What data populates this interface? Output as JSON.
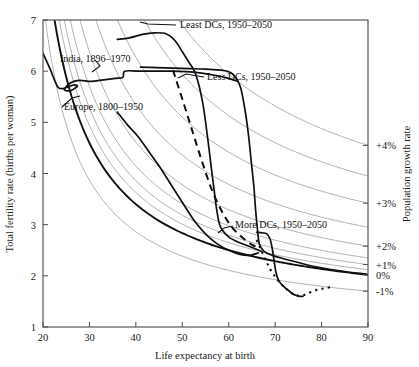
{
  "chart_data": {
    "type": "line",
    "title": "",
    "xlabel": "Life expectancy at birth",
    "ylabel": "Total fertility rate (births per woman)",
    "y2label": "Population growth rate",
    "xlim": [
      20,
      90
    ],
    "ylim": [
      1,
      7
    ],
    "xticks": [
      "20",
      "30",
      "40",
      "50",
      "60",
      "70",
      "80",
      "90"
    ],
    "yticks": [
      "1",
      "2",
      "3",
      "4",
      "5",
      "6",
      "7"
    ],
    "y2ticks": [
      "+4%",
      "+3%",
      "+2%",
      "+1%",
      "0%",
      "-1%"
    ],
    "grid": false,
    "legend_position": "inline-annotations",
    "iso_contours": [
      {
        "growth_pct": 4.0,
        "label": "+4%",
        "bold": false,
        "y_at_x90": 4.55
      },
      {
        "growth_pct": 3.5,
        "label": "",
        "bold": false,
        "y_at_x90": 3.95
      },
      {
        "growth_pct": 3.0,
        "label": "+3%",
        "bold": false,
        "y_at_x90": 3.42
      },
      {
        "growth_pct": 2.5,
        "label": "",
        "bold": false,
        "y_at_x90": 2.95
      },
      {
        "growth_pct": 2.0,
        "label": "+2%",
        "bold": false,
        "y_at_x90": 2.58
      },
      {
        "growth_pct": 1.5,
        "label": "",
        "bold": false,
        "y_at_x90": 2.35
      },
      {
        "growth_pct": 1.0,
        "label": "+1%",
        "bold": false,
        "y_at_x90": 2.22
      },
      {
        "growth_pct": 0.5,
        "label": "",
        "bold": false,
        "y_at_x90": 2.12
      },
      {
        "growth_pct": 0.0,
        "label": "0%",
        "bold": true,
        "y_at_x90": 2.02
      },
      {
        "growth_pct": -1.0,
        "label": "-1%",
        "bold": false,
        "y_at_x90": 1.7
      }
    ],
    "series": [
      {
        "name": "India, 1896-1970",
        "label": "India, 1896–1970",
        "style": "solid",
        "points": [
          [
            20.0,
            6.35
          ],
          [
            21.5,
            6.05
          ],
          [
            22.6,
            5.8
          ],
          [
            23.3,
            5.68
          ],
          [
            24.4,
            5.66
          ],
          [
            25.6,
            5.7
          ],
          [
            26.6,
            5.73
          ],
          [
            27.4,
            5.71
          ],
          [
            26.0,
            5.62
          ],
          [
            24.6,
            5.64
          ],
          [
            25.9,
            5.77
          ],
          [
            27.8,
            5.82
          ],
          [
            30.4,
            5.8
          ],
          [
            33.0,
            5.83
          ],
          [
            35.6,
            5.86
          ],
          [
            37.2,
            5.88
          ],
          [
            37.6,
            6.0
          ],
          [
            40.5,
            6.0
          ],
          [
            44.0,
            6.0
          ],
          [
            47.5,
            6.0
          ],
          [
            50.8,
            5.99
          ],
          [
            54.2,
            5.96
          ],
          [
            57.0,
            5.92
          ],
          [
            59.6,
            5.87
          ],
          [
            62.0,
            5.8
          ]
        ]
      },
      {
        "name": "Europe, 1800-1950",
        "label": "Europe, 1800–1950",
        "style": "solid",
        "points": [
          [
            36.0,
            5.2
          ],
          [
            38.2,
            4.95
          ],
          [
            40.5,
            4.72
          ],
          [
            43.0,
            4.4
          ],
          [
            45.5,
            4.08
          ],
          [
            48.0,
            3.72
          ],
          [
            50.4,
            3.38
          ],
          [
            52.8,
            3.05
          ],
          [
            55.2,
            2.8
          ],
          [
            57.6,
            2.62
          ],
          [
            60.0,
            2.5
          ],
          [
            62.4,
            2.42
          ],
          [
            64.6,
            2.4
          ],
          [
            66.4,
            2.45
          ]
        ]
      },
      {
        "name": "Least DCs, 1950-2050",
        "label": "Least DCs, 1950–2050",
        "style": "solid",
        "points": [
          [
            36.0,
            6.62
          ],
          [
            38.6,
            6.65
          ],
          [
            41.4,
            6.72
          ],
          [
            44.0,
            6.75
          ],
          [
            46.5,
            6.73
          ],
          [
            48.4,
            6.6
          ],
          [
            50.0,
            6.38
          ],
          [
            51.4,
            6.18
          ],
          [
            52.6,
            6.0
          ],
          [
            53.6,
            5.72
          ],
          [
            54.4,
            5.38
          ],
          [
            55.0,
            5.02
          ],
          [
            55.6,
            4.6
          ],
          [
            56.2,
            4.15
          ],
          [
            56.8,
            3.72
          ],
          [
            57.4,
            3.3
          ],
          [
            58.2,
            2.96
          ],
          [
            60.0,
            2.76
          ],
          [
            62.5,
            2.64
          ],
          [
            65.2,
            2.55
          ],
          [
            67.0,
            2.48
          ]
        ]
      },
      {
        "name": "Less DCs, 1950-2050",
        "label": "Less DCs, 1950–2050",
        "style": "solid",
        "points": [
          [
            41.0,
            6.08
          ],
          [
            44.5,
            6.07
          ],
          [
            48.0,
            6.06
          ],
          [
            51.5,
            6.05
          ],
          [
            55.0,
            6.04
          ],
          [
            58.4,
            6.02
          ],
          [
            60.6,
            5.96
          ],
          [
            62.4,
            5.72
          ],
          [
            63.4,
            5.3
          ],
          [
            64.2,
            4.8
          ],
          [
            64.8,
            4.28
          ],
          [
            65.4,
            3.76
          ],
          [
            65.8,
            3.28
          ],
          [
            66.2,
            2.9
          ],
          [
            66.6,
            2.62
          ],
          [
            67.6,
            2.48
          ],
          [
            69.4,
            2.4
          ],
          [
            72.0,
            2.33
          ],
          [
            75.0,
            2.26
          ],
          [
            78.5,
            2.18
          ],
          [
            82.0,
            2.12
          ],
          [
            86.0,
            2.07
          ],
          [
            89.5,
            2.04
          ]
        ]
      },
      {
        "name": "More DCs, 1950-2050",
        "label": "More DCs, 1950–2050",
        "style": "solid-then-dotted",
        "points": [
          [
            66.0,
            2.85
          ],
          [
            67.2,
            2.84
          ],
          [
            68.2,
            2.82
          ],
          [
            68.9,
            2.72
          ],
          [
            69.4,
            2.52
          ],
          [
            69.8,
            2.28
          ],
          [
            70.2,
            2.06
          ],
          [
            70.7,
            1.92
          ],
          [
            71.3,
            1.84
          ],
          [
            72.0,
            1.78
          ],
          [
            72.8,
            1.72
          ],
          [
            73.6,
            1.66
          ],
          [
            74.4,
            1.62
          ],
          [
            75.2,
            1.6
          ],
          [
            76.0,
            1.6
          ]
        ]
      },
      {
        "name": "Less DCs projection",
        "label": "",
        "style": "dashed",
        "points": [
          [
            48.0,
            6.02
          ],
          [
            50.2,
            5.4
          ],
          [
            52.2,
            4.82
          ],
          [
            54.2,
            4.25
          ],
          [
            56.2,
            3.72
          ],
          [
            58.4,
            3.28
          ],
          [
            60.6,
            2.96
          ],
          [
            62.8,
            2.76
          ],
          [
            64.8,
            2.62
          ],
          [
            66.4,
            2.55
          ]
        ]
      },
      {
        "name": "More DCs projection",
        "label": "",
        "style": "dotted",
        "points": [
          [
            66.0,
            2.7
          ],
          [
            67.0,
            2.5
          ],
          [
            68.0,
            2.3
          ],
          [
            69.0,
            2.12
          ],
          [
            70.2,
            1.96
          ],
          [
            71.5,
            1.82
          ],
          [
            73.0,
            1.7
          ],
          [
            74.4,
            1.62
          ],
          [
            76.0,
            1.62
          ],
          [
            77.6,
            1.68
          ],
          [
            79.2,
            1.73
          ],
          [
            80.8,
            1.76
          ],
          [
            82.2,
            1.78
          ]
        ]
      }
    ],
    "annotations": [
      {
        "name": "least-dcs",
        "text": "Least DCs, 1950–2050",
        "x_px": 180,
        "y_px": 28
      },
      {
        "name": "india",
        "text": "India, 1896–1970",
        "x_px": 60,
        "y_px": 62
      },
      {
        "name": "less-dcs",
        "text": "Less DCs, 1950–2050",
        "x_px": 207,
        "y_px": 80
      },
      {
        "name": "europe",
        "text": "Europe, 1800–1950",
        "x_px": 64,
        "y_px": 110
      },
      {
        "name": "more-dcs",
        "text": "More DCs, 1950–2050",
        "x_px": 235,
        "y_px": 228
      }
    ]
  }
}
